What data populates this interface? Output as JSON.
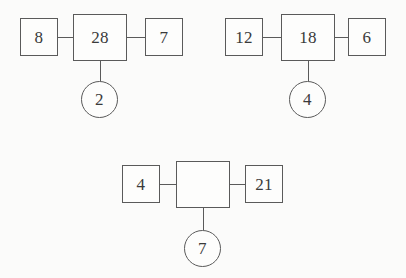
{
  "diagram": {
    "title": "",
    "type": "number-machine-puzzle",
    "stroke_color": "#5a5a5a",
    "background_color": "#fbfbfa",
    "text_color": "#3a3a3a",
    "groups": [
      {
        "id": "group-1",
        "left": "8",
        "center": "28",
        "right": "7",
        "bottom": "2"
      },
      {
        "id": "group-2",
        "left": "12",
        "center": "18",
        "right": "6",
        "bottom": "4"
      },
      {
        "id": "group-3",
        "left": "4",
        "center": "",
        "right": "21",
        "bottom": "7"
      }
    ]
  }
}
